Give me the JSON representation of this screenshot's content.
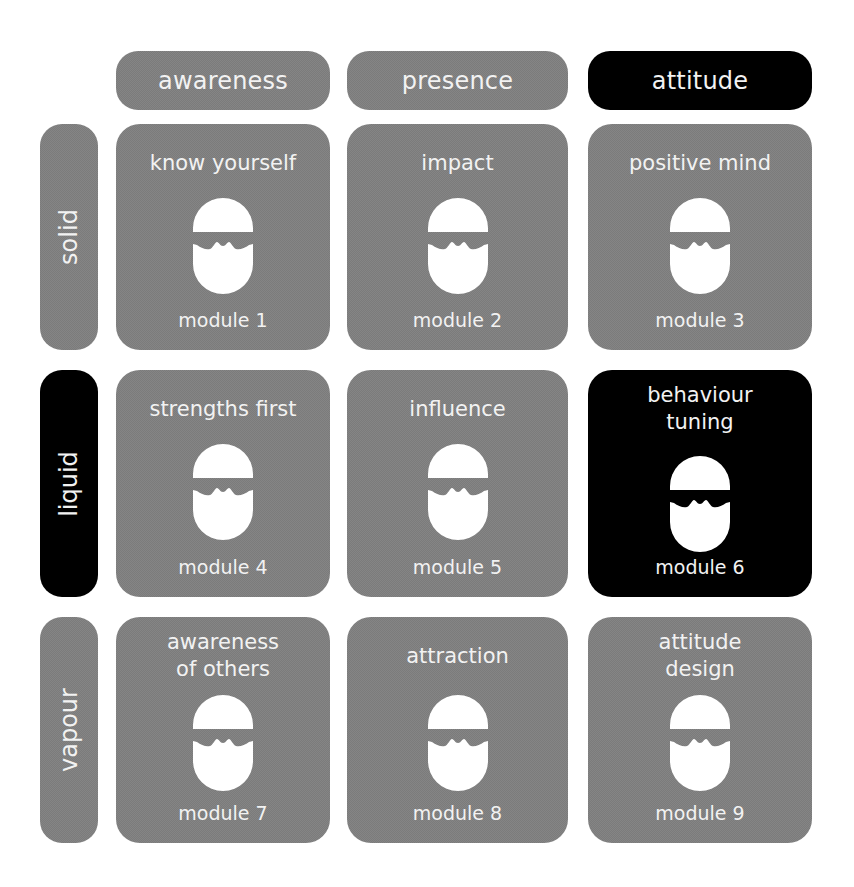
{
  "colors": {
    "gray": "#7b7b7b",
    "highlight": "#000000",
    "text": "#f2f2f2",
    "background": "#ffffff"
  },
  "columns": [
    {
      "label": "awareness",
      "highlighted": false
    },
    {
      "label": "presence",
      "highlighted": false
    },
    {
      "label": "attitude",
      "highlighted": true
    }
  ],
  "rows": [
    {
      "label": "solid",
      "highlighted": false
    },
    {
      "label": "liquid",
      "highlighted": true
    },
    {
      "label": "vapour",
      "highlighted": false
    }
  ],
  "cells": [
    {
      "title": "know yourself",
      "module": "module 1",
      "icon": "sunglasses-face-icon",
      "highlighted": false
    },
    {
      "title": "impact",
      "module": "module 2",
      "icon": "sunglasses-face-icon",
      "highlighted": false
    },
    {
      "title": "positive mind",
      "module": "module 3",
      "icon": "sunglasses-face-icon",
      "highlighted": false
    },
    {
      "title": "strengths first",
      "module": "module 4",
      "icon": "sunglasses-face-icon",
      "highlighted": false
    },
    {
      "title": "influence",
      "module": "module 5",
      "icon": "sunglasses-face-icon",
      "highlighted": false
    },
    {
      "title": "behaviour\ntuning",
      "module": "module 6",
      "icon": "sunglasses-face-icon",
      "highlighted": true
    },
    {
      "title": "awareness\nof others",
      "module": "module 7",
      "icon": "sunglasses-face-icon",
      "highlighted": false
    },
    {
      "title": "attraction",
      "module": "module 8",
      "icon": "sunglasses-face-icon",
      "highlighted": false
    },
    {
      "title": "attitude\ndesign",
      "module": "module 9",
      "icon": "sunglasses-face-icon",
      "highlighted": false
    }
  ]
}
